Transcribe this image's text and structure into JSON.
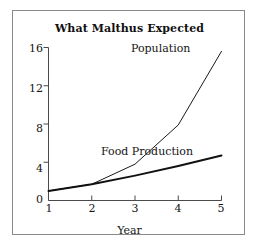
{
  "chart_data": {
    "type": "line",
    "title": "What Malthus Expected",
    "xlabel": "Year",
    "ylabel": "",
    "xlim": [
      1,
      5
    ],
    "ylim": [
      0,
      16
    ],
    "grid": false,
    "legend_position": "inline-annotation",
    "x": [
      1,
      2,
      3,
      4,
      5
    ],
    "xtick_labels": [
      "1",
      "2",
      "3",
      "4",
      "5"
    ],
    "ytick_labels": [
      "0",
      "4",
      "8",
      "12",
      "16"
    ],
    "ytick_values": [
      0,
      4,
      8,
      12,
      16
    ],
    "series": [
      {
        "name": "Population",
        "values": [
          1.0,
          1.7,
          3.8,
          7.9,
          15.6
        ],
        "line_width": 1,
        "color": "#1a1a1a",
        "annotation": "Population"
      },
      {
        "name": "Food Production",
        "values": [
          1.0,
          1.7,
          2.6,
          3.6,
          4.7
        ],
        "line_width": 2,
        "color": "#111111",
        "annotation": "Food Production"
      }
    ],
    "annotations": [
      "Population",
      "Food Production"
    ]
  },
  "figure": {
    "title": "What Malthus Expected",
    "axis_label_x": "Year",
    "border_color": "#8a8a8a",
    "background_color": "#ffffff",
    "axis_color": "#4a4a4a"
  },
  "labels": {
    "population": "Population",
    "food_production": "Food Production"
  },
  "yticks": {
    "t0": "0",
    "t1": "4",
    "t2": "8",
    "t3": "12",
    "t4": "16"
  },
  "xticks": {
    "t0": "1",
    "t1": "2",
    "t2": "3",
    "t3": "4",
    "t4": "5"
  }
}
